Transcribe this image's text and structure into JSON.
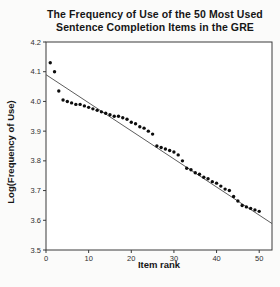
{
  "figure": {
    "title_line1": "The Frequency of Use of the 50 Most Used",
    "title_line2": "Sentence Completion Items in the GRE"
  },
  "chart_data": {
    "type": "scatter",
    "title": "The Frequency of Use of the 50 Most Used Sentence Completion Items in the GRE",
    "xlabel": "Item rank",
    "ylabel": "Log(Frequency of Use)",
    "xlim": [
      0,
      53
    ],
    "ylim": [
      3.5,
      4.2
    ],
    "x_ticks": [
      0,
      10,
      20,
      30,
      40,
      50
    ],
    "y_ticks": [
      4.2,
      4.1,
      4.0,
      3.9,
      3.8,
      3.7,
      3.6,
      3.5
    ],
    "grid": false,
    "legend": false,
    "marker_color": "#0d0d0d",
    "frame_color": "#3a3a3a",
    "background_color": "#ffffff",
    "trendline": {
      "x1": 0,
      "y1": 4.09,
      "x2": 53,
      "y2": 3.589,
      "color": "#4a4a4a"
    },
    "series": [
      {
        "name": "Log frequency of use",
        "x": [
          1,
          2,
          3,
          4,
          5,
          6,
          7,
          8,
          9,
          10,
          11,
          12,
          13,
          14,
          15,
          16,
          17,
          18,
          19,
          20,
          21,
          22,
          23,
          24,
          25,
          26,
          27,
          28,
          29,
          30,
          31,
          32,
          33,
          34,
          35,
          36,
          37,
          38,
          39,
          40,
          41,
          42,
          43,
          44,
          45,
          46,
          47,
          48,
          49,
          50
        ],
        "y": [
          4.13,
          4.1,
          4.035,
          4.005,
          4.0,
          3.995,
          3.99,
          3.99,
          3.985,
          3.98,
          3.975,
          3.97,
          3.965,
          3.96,
          3.955,
          3.95,
          3.95,
          3.945,
          3.94,
          3.93,
          3.925,
          3.915,
          3.91,
          3.9,
          3.89,
          3.85,
          3.845,
          3.84,
          3.835,
          3.83,
          3.82,
          3.8,
          3.775,
          3.77,
          3.76,
          3.755,
          3.745,
          3.74,
          3.73,
          3.725,
          3.715,
          3.705,
          3.7,
          3.68,
          3.665,
          3.65,
          3.645,
          3.64,
          3.635,
          3.63
        ]
      }
    ]
  }
}
